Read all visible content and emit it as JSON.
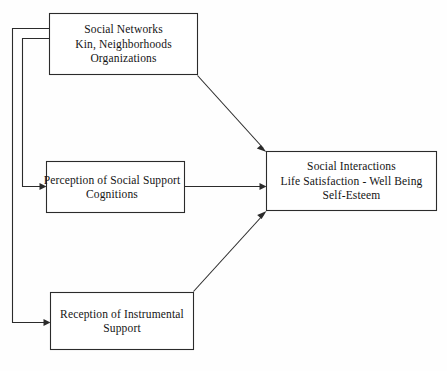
{
  "diagram": {
    "background_color": "#fefefe",
    "line_color": "#2b2b2b",
    "text_color": "#141414",
    "nodes": [
      {
        "id": "social-networks",
        "lines": [
          "Social Networks",
          "Kin, Neighborhoods",
          "Organizations"
        ],
        "line1": "Social Networks",
        "line2": "Kin, Neighborhoods",
        "line3": "Organizations"
      },
      {
        "id": "perception",
        "lines": [
          "Perception of Social Support",
          "Cognitions"
        ],
        "line1": "Perception of Social Support",
        "line2": "Cognitions"
      },
      {
        "id": "reception",
        "lines": [
          "Reception of Instrumental",
          "Support"
        ],
        "line1": "Reception of Instrumental",
        "line2": "Support"
      },
      {
        "id": "outcomes",
        "lines": [
          "Social Interactions",
          "Life Satisfaction - Well Being",
          "Self-Esteem"
        ],
        "line1": "Social Interactions",
        "line2": "Life Satisfaction - Well Being",
        "line3": "Self-Esteem"
      }
    ],
    "edges": [
      {
        "id": "networks-to-outcomes",
        "from": "social-networks",
        "to": "outcomes",
        "style": "diagonal-arrow"
      },
      {
        "id": "networks-to-perception",
        "from": "social-networks",
        "to": "perception",
        "style": "left-routed-arrow"
      },
      {
        "id": "networks-to-reception",
        "from": "social-networks",
        "to": "reception",
        "style": "left-routed-arrow"
      },
      {
        "id": "perception-to-outcomes",
        "from": "perception",
        "to": "outcomes",
        "style": "horizontal-arrow"
      },
      {
        "id": "reception-to-outcomes",
        "from": "reception",
        "to": "outcomes",
        "style": "diagonal-arrow"
      }
    ]
  }
}
